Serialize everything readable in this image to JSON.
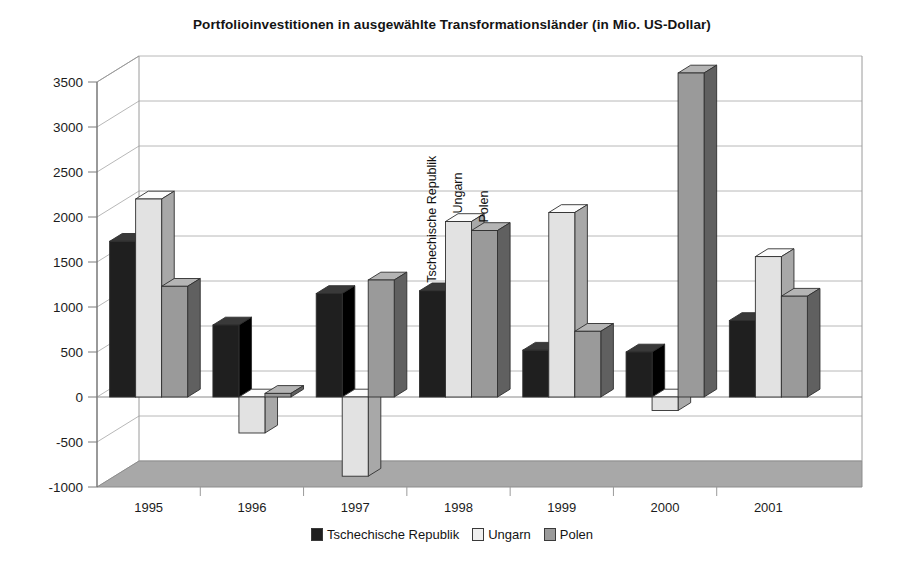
{
  "chart_data": {
    "type": "bar",
    "title": "Portfolioinvestitionen in ausgewählte Transformationsländer (in Mio. US-Dollar)",
    "xlabel": "",
    "ylabel": "",
    "ylim": [
      -1000,
      3500
    ],
    "ytick_step": 500,
    "yticks": [
      "3500",
      "3000",
      "2500",
      "2000",
      "1500",
      "1000",
      "500",
      "0",
      "-500",
      "-1000"
    ],
    "categories": [
      "1995",
      "1996",
      "1997",
      "1998",
      "1999",
      "2000",
      "2001"
    ],
    "grid": true,
    "legend_position": "bottom",
    "style": "3d-column",
    "series": [
      {
        "name": "Tschechische Republik",
        "color": "#1f1f1f",
        "values": [
          1730,
          800,
          1150,
          1180,
          520,
          500,
          850
        ]
      },
      {
        "name": "Ungarn",
        "color": "#e2e2e2",
        "values": [
          2200,
          -400,
          -880,
          1950,
          2050,
          -150,
          1560
        ]
      },
      {
        "name": "Polen",
        "color": "#9a9a9a",
        "values": [
          1230,
          40,
          1300,
          1850,
          730,
          3600,
          1120
        ]
      }
    ],
    "annotations": [
      {
        "text": "Tschechische Republik",
        "at_category": "1998",
        "series": "Tschechische Republik",
        "rotated": true
      },
      {
        "text": "Ungarn",
        "at_category": "1998",
        "series": "Ungarn",
        "rotated": true
      },
      {
        "text": "Polen",
        "at_category": "1998",
        "series": "Polen",
        "rotated": true
      }
    ]
  },
  "legend": {
    "items": [
      {
        "label": "Tschechische Republik",
        "color": "#1f1f1f"
      },
      {
        "label": "Ungarn",
        "color": "#efefef"
      },
      {
        "label": "Polen",
        "color": "#9a9a9a"
      }
    ]
  },
  "colors": {
    "axis": "#7a7a7a",
    "grid": "#b8b8b8",
    "floor": "#a8a8a8",
    "text": "#1a1a1a"
  }
}
